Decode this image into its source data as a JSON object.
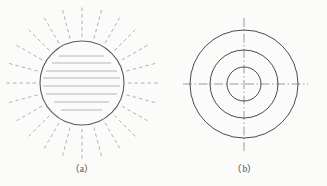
{
  "page": {
    "background_color": "#fbfbfa",
    "width": 327,
    "height": 186
  },
  "figures": [
    {
      "id": "figure-a",
      "caption": "（a）",
      "description": "circle-with-radiating-dashed-rays",
      "colors": {
        "circle_stroke": "#5a5a5f",
        "ray_stroke": "#a8a8ab",
        "hatch_stroke": "#b5b5b8"
      },
      "circle": {
        "cx": 82,
        "cy": 83,
        "r": 42,
        "stroke_width": 1.1
      },
      "rays": {
        "count": 24,
        "inner_radius": 46,
        "outer_radius": 76,
        "dash_pattern": "3.5 3",
        "stroke_width": 0.9,
        "start_angle_deg": 0
      },
      "hatch_lines": [
        {
          "y": 56,
          "x1": 59,
          "x2": 104
        },
        {
          "y": 63,
          "x1": 52,
          "x2": 111
        },
        {
          "y": 71,
          "x1": 46,
          "x2": 117
        },
        {
          "y": 78,
          "x1": 43,
          "x2": 120
        },
        {
          "y": 86,
          "x1": 43,
          "x2": 120
        },
        {
          "y": 94,
          "x1": 46,
          "x2": 117
        },
        {
          "y": 102,
          "x1": 54,
          "x2": 109
        },
        {
          "y": 110,
          "x1": 61,
          "x2": 102
        }
      ]
    },
    {
      "id": "figure-b",
      "caption": "（b）",
      "description": "three-concentric-circles-with-centerlines",
      "colors": {
        "circle_stroke": "#4a4a4f",
        "centerline_stroke": "#8f8f93"
      },
      "center": {
        "cx": 81,
        "cy": 84
      },
      "circles": [
        {
          "r": 17,
          "stroke_width": 1.0
        },
        {
          "r": 34,
          "stroke_width": 1.0
        },
        {
          "r": 54,
          "stroke_width": 1.0
        }
      ],
      "centerlines": {
        "horizontal": {
          "x1": 20,
          "x2": 145,
          "y": 84
        },
        "vertical": {
          "y1": 18,
          "y2": 151,
          "x": 81
        },
        "dash_pattern": "9 2.5 1.5 2.5",
        "stroke_width": 0.9
      }
    }
  ]
}
